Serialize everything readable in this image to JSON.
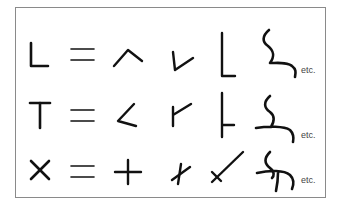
{
  "diagram": {
    "type": "junction-equivalence-table",
    "rows": [
      {
        "junction": "L",
        "relation": "=",
        "variants": [
          "angle-caret",
          "check-angle",
          "tall-L",
          "squiggle-L"
        ],
        "suffix": "etc."
      },
      {
        "junction": "T",
        "relation": "=",
        "variants": [
          "arrow-left-T",
          "Y-like-T",
          "tall-T-right",
          "squiggle-T"
        ],
        "suffix": "etc."
      },
      {
        "junction": "X",
        "relation": "=",
        "variants": [
          "plus",
          "slanted-cross",
          "long-diagonal-cross",
          "squiggle-X"
        ],
        "suffix": "etc."
      }
    ],
    "colors": {
      "stroke": "#111111",
      "border": "#8a8a8a",
      "background": "#ffffff",
      "etc_text": "#444444"
    }
  }
}
